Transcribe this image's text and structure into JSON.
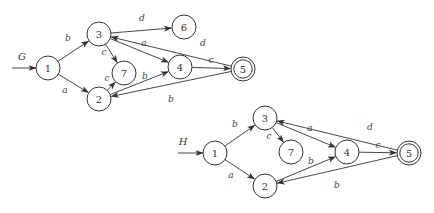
{
  "graphs": [
    {
      "name": "G",
      "name_pos": [
        22,
        56
      ],
      "start_arrow": {
        "from": [
          12,
          68
        ],
        "to": [
          36,
          68
        ]
      },
      "nodes": [
        {
          "id": "1",
          "x": 48,
          "y": 68,
          "accepting": false
        },
        {
          "id": "2",
          "x": 99,
          "y": 99,
          "accepting": false
        },
        {
          "id": "3",
          "x": 99,
          "y": 34,
          "accepting": false
        },
        {
          "id": "4",
          "x": 180,
          "y": 67,
          "accepting": false
        },
        {
          "id": "5",
          "x": 243,
          "y": 69,
          "accepting": true
        },
        {
          "id": "6",
          "x": 184,
          "y": 27,
          "accepting": false
        },
        {
          "id": "7",
          "x": 124,
          "y": 73,
          "accepting": false
        }
      ],
      "edges": [
        {
          "from": "1",
          "to": "3",
          "label": "b",
          "label_pos": [
            68,
            38
          ]
        },
        {
          "from": "1",
          "to": "2",
          "label": "a",
          "label_pos": [
            65,
            90
          ]
        },
        {
          "from": "3",
          "to": "6",
          "label": "d",
          "label_pos": [
            142,
            18
          ]
        },
        {
          "from": "3",
          "to": "7",
          "label": "c",
          "label_pos": [
            104,
            52
          ]
        },
        {
          "from": "3",
          "to": "4",
          "label": "a",
          "label_pos": [
            144,
            43
          ]
        },
        {
          "from": "2",
          "to": "7",
          "label": "c",
          "label_pos": [
            107,
            78
          ]
        },
        {
          "from": "2",
          "to": "4",
          "label": "b",
          "label_pos": [
            145,
            76
          ]
        },
        {
          "from": "4",
          "to": "5",
          "label": "c",
          "label_pos": [
            211,
            60
          ]
        },
        {
          "from": "5",
          "to": "3",
          "label": "d",
          "label_pos": [
            203,
            43
          ]
        },
        {
          "from": "5",
          "to": "2",
          "label": "b",
          "label_pos": [
            171,
            99
          ]
        }
      ]
    },
    {
      "name": "H",
      "name_pos": [
        183,
        141
      ],
      "start_arrow": {
        "from": [
          178,
          153
        ],
        "to": [
          203,
          153
        ]
      },
      "nodes": [
        {
          "id": "1",
          "x": 215,
          "y": 153,
          "accepting": false
        },
        {
          "id": "2",
          "x": 265,
          "y": 186,
          "accepting": false
        },
        {
          "id": "3",
          "x": 265,
          "y": 118,
          "accepting": false
        },
        {
          "id": "4",
          "x": 347,
          "y": 152,
          "accepting": false
        },
        {
          "id": "5",
          "x": 409,
          "y": 153,
          "accepting": true
        },
        {
          "id": "7",
          "x": 291,
          "y": 152,
          "accepting": false
        }
      ],
      "edges": [
        {
          "from": "1",
          "to": "3",
          "label": "b",
          "label_pos": [
            235,
            124
          ]
        },
        {
          "from": "1",
          "to": "2",
          "label": "a",
          "label_pos": [
            231,
            175
          ]
        },
        {
          "from": "3",
          "to": "7",
          "label": "c",
          "label_pos": [
            269,
            136
          ]
        },
        {
          "from": "3",
          "to": "4",
          "label": "a",
          "label_pos": [
            310,
            128
          ]
        },
        {
          "from": "2",
          "to": "4",
          "label": "b",
          "label_pos": [
            311,
            161
          ]
        },
        {
          "from": "4",
          "to": "5",
          "label": "c",
          "label_pos": [
            378,
            145
          ]
        },
        {
          "from": "5",
          "to": "3",
          "label": "d",
          "label_pos": [
            370,
            127
          ]
        },
        {
          "from": "5",
          "to": "2",
          "label": "b",
          "label_pos": [
            337,
            185
          ]
        }
      ]
    }
  ]
}
